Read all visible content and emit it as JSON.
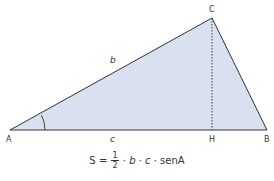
{
  "figure": {
    "type": "triangle-area-diagram",
    "fill_color": "#d9e1f0",
    "stroke_color": "#333333",
    "vertices": {
      "A": {
        "label": "A",
        "x": 10,
        "y": 130
      },
      "B": {
        "label": "B",
        "x": 267,
        "y": 130
      },
      "C": {
        "label": "C",
        "x": 212,
        "y": 18
      },
      "H": {
        "label": "H",
        "x": 212,
        "y": 130
      }
    },
    "sides": {
      "b": {
        "label": "b"
      },
      "c": {
        "label": "c"
      }
    },
    "height_line": {
      "from": "C",
      "to": "H",
      "style": "dashed"
    },
    "angle_mark": {
      "at": "A"
    }
  },
  "formula": {
    "lhs": "S",
    "equals": "=",
    "fraction_numerator": "1",
    "fraction_denominator": "2",
    "dot1": "·",
    "var_b": "b",
    "dot2": "·",
    "var_c": "c",
    "dot3": "·",
    "func": "senA"
  }
}
